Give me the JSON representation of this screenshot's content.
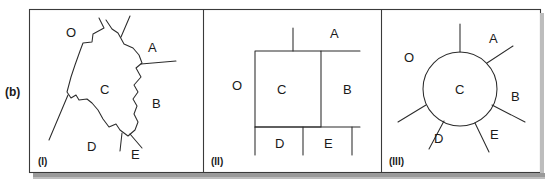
{
  "figure": {
    "row_label": "(b)",
    "background": "#ffffff",
    "line_color": "#2b2b2b",
    "frame_color": "#3a3a3a",
    "shadow_color": "#9a9a9a",
    "text_color": "#1a1a1a"
  },
  "panels": [
    {
      "id": "panel-i",
      "caption": "(I)",
      "title_hint": "irregular-polygon-map",
      "regions": [
        {
          "name": "O",
          "label": "O",
          "x": 66,
          "y": 25
        },
        {
          "name": "A",
          "label": "A",
          "x": 148,
          "y": 40
        },
        {
          "name": "C",
          "label": "C",
          "x": 100,
          "y": 82
        },
        {
          "name": "B",
          "label": "B",
          "x": 152,
          "y": 96
        },
        {
          "name": "D",
          "label": "D",
          "x": 87,
          "y": 139
        },
        {
          "name": "E",
          "label": "E",
          "x": 131,
          "y": 147
        }
      ]
    },
    {
      "id": "panel-ii",
      "caption": "(II)",
      "title_hint": "rectilinear-schematic-map",
      "regions": [
        {
          "name": "A",
          "label": "A",
          "x": 330,
          "y": 28
        },
        {
          "name": "O",
          "label": "O",
          "x": 232,
          "y": 82
        },
        {
          "name": "C",
          "label": "C",
          "x": 277,
          "y": 87
        },
        {
          "name": "B",
          "label": "B",
          "x": 343,
          "y": 87
        },
        {
          "name": "D",
          "label": "D",
          "x": 277,
          "y": 147
        },
        {
          "name": "E",
          "label": "E",
          "x": 327,
          "y": 147
        }
      ]
    },
    {
      "id": "panel-iii",
      "caption": "(III)",
      "title_hint": "circular-schematic-map",
      "regions": [
        {
          "name": "A",
          "label": "A",
          "x": 490,
          "y": 36
        },
        {
          "name": "O",
          "label": "O",
          "x": 405,
          "y": 57
        },
        {
          "name": "C",
          "label": "C",
          "x": 457,
          "y": 89
        },
        {
          "name": "B",
          "label": "B",
          "x": 512,
          "y": 96
        },
        {
          "name": "D",
          "label": "D",
          "x": 436,
          "y": 140
        },
        {
          "name": "E",
          "label": "E",
          "x": 492,
          "y": 137
        }
      ]
    }
  ],
  "geometry": {
    "panel_i_outline": "M 99,18 L 104,28 L 93,34 L 92,42 L 83,43 L 80,51 L 75,65 L 71,77 L 67,92 L 71,98 L 76,95 L 79,100 L 87,99 L 92,103 L 98,110 L 103,119 L 109,127 L 116,124 L 120,130 L 128,136 L 135,130 L 138,122 L 134,114 L 137,106 L 133,99 L 138,92 L 134,85 L 141,77 L 136,68 L 142,63 L 139,55 L 133,48 L 124,44 L 118,33 L 112,29 L 106,20",
    "panel_i_spur_top": "M 121,37 L 129,17",
    "panel_i_spur_right": "M 141,64 L 175,61",
    "panel_i_spur_se": "M 129,135 L 141,147",
    "panel_i_spur_s": "M 123,133 L 121,150",
    "panel_i_spur_sw": "M 68,95 L 50,140",
    "panel_ii_rect_c": "M 255,51 L 321,51 L 321,127 L 255,127 Z",
    "panel_ii_rect_b_right": "M 321,51 L 352,51 M 321,127 L 352,127",
    "panel_ii_top_stub": "M 293,51 L 293,28",
    "panel_ii_top_right_line": "M 321,51 L 360,51",
    "panel_ii_bottom_line": "M 255,127 L 360,127",
    "panel_ii_div_b": "M 321,51 L 321,127",
    "panel_ii_left_bottom_stub": "M 255,127 L 255,154",
    "panel_ii_mid_bottom_stub": "M 303,127 L 303,154",
    "panel_ii_right_bottom_stub": "M 352,127 L 352,154",
    "panel_iii_circle": {
      "cx": 460,
      "cy": 89,
      "r": 37
    },
    "panel_iii_spokes": [
      "M 460,52 L 460,24",
      "M 486,63 L 512,46",
      "M 493,104 L 525,121",
      "M 476,122 L 489,151",
      "M 444,121 L 429,149",
      "M 426,105 L 398,122"
    ],
    "frame": {
      "x": 29,
      "y": 9,
      "w": 512,
      "h": 164
    },
    "dividers": [
      203,
      381
    ],
    "shadow": {
      "x": 33,
      "y": 173,
      "w": 512,
      "h": 5
    }
  }
}
